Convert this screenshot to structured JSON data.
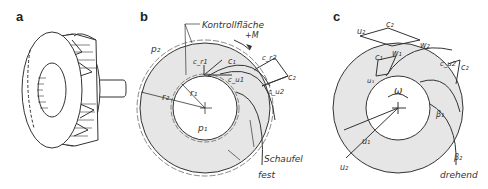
{
  "figure": {
    "panels": [
      {
        "id": "a",
        "letter": "a",
        "subject": "impeller-perspective"
      },
      {
        "id": "b",
        "letter": "b",
        "subject": "control-surface-fixed"
      },
      {
        "id": "c",
        "letter": "c",
        "subject": "rotating-impeller-velocity-triangles"
      }
    ],
    "panel_b": {
      "control_surface_label": "Kontrollfläche",
      "moment_label": "+M",
      "p2": "p₂",
      "p1": "p₁",
      "r2": "r₂",
      "r1": "r₁",
      "cr1": "c_r1",
      "c1": "c₁",
      "cu1": "c_u1",
      "cr2": "c_r2",
      "c2": "c₂",
      "cu2": "c_u2",
      "blade_label": "Schaufel",
      "frame_label": "fest"
    },
    "panel_c": {
      "u2_top": "u₂",
      "c2_top": "c₂",
      "w2": "w₂",
      "c1": "c₁",
      "w1": "w₁",
      "u1_top": "u₁",
      "cu2": "c_u2",
      "c2_right": "c₂",
      "omega": "ω",
      "beta1": "β₁",
      "beta2": "β₂",
      "u1": "u₁",
      "u2": "u₂",
      "frame_label": "drehend"
    },
    "colors": {
      "line": "#333333",
      "fill_shaded": "#e6e6e6",
      "background": "#ffffff"
    }
  }
}
